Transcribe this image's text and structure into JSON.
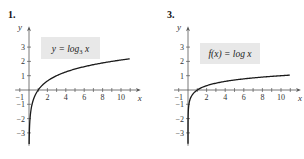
{
  "chart_data": [
    {
      "type": "line",
      "problem_number": "1.",
      "title": "",
      "annotation": "y = log₃ x",
      "annotation_parts": {
        "lhs": "y = log",
        "sub": "3",
        "rhs": " x"
      },
      "xlabel": "x",
      "ylabel": "y",
      "xlim": [
        -1.5,
        11.5
      ],
      "ylim": [
        -3.9,
        4.1
      ],
      "xticks": [
        -1,
        1,
        2,
        3,
        4,
        5,
        6,
        7,
        8,
        9,
        10,
        11
      ],
      "xtick_labels": [
        {
          "v": -1,
          "t": "−1"
        },
        {
          "v": 2,
          "t": "2"
        },
        {
          "v": 4,
          "t": "4"
        },
        {
          "v": 6,
          "t": "6"
        },
        {
          "v": 8,
          "t": "8"
        },
        {
          "v": 10,
          "t": "10"
        }
      ],
      "yticks": [
        -3,
        -2,
        -1,
        1,
        2,
        3
      ],
      "ytick_labels": [
        {
          "v": -3,
          "t": "−3"
        },
        {
          "v": -2,
          "t": "−2"
        },
        {
          "v": -1,
          "t": "−1"
        },
        {
          "v": 1,
          "t": "1"
        },
        {
          "v": 2,
          "t": "2"
        },
        {
          "v": 3,
          "t": "3"
        }
      ],
      "grid": false,
      "function": "log3",
      "series": [
        {
          "name": "y = log3 x",
          "x": [
            0.02,
            0.05,
            0.1,
            0.2,
            0.33,
            0.5,
            1,
            1.5,
            2,
            3,
            4,
            5,
            6,
            7,
            8,
            9,
            10,
            11
          ],
          "y": [
            -3.56,
            -2.73,
            -2.1,
            -1.46,
            -1.0,
            -0.63,
            0,
            0.37,
            0.63,
            1.0,
            1.26,
            1.46,
            1.63,
            1.77,
            1.89,
            2.0,
            2.1,
            2.18
          ]
        }
      ]
    },
    {
      "type": "line",
      "problem_number": "3.",
      "title": "",
      "annotation": "f(x) = log x",
      "annotation_parts": {
        "lhs": "f(x) = log x",
        "sub": "",
        "rhs": ""
      },
      "xlabel": "x",
      "ylabel": "y",
      "xlim": [
        -1.5,
        11.5
      ],
      "ylim": [
        -3.9,
        4.1
      ],
      "xticks": [
        -1,
        1,
        2,
        3,
        4,
        5,
        6,
        7,
        8,
        9,
        10,
        11
      ],
      "xtick_labels": [
        {
          "v": -1,
          "t": "−1"
        },
        {
          "v": 2,
          "t": "2"
        },
        {
          "v": 4,
          "t": "4"
        },
        {
          "v": 6,
          "t": "6"
        },
        {
          "v": 8,
          "t": "8"
        },
        {
          "v": 10,
          "t": "10"
        }
      ],
      "yticks": [
        -3,
        -2,
        -1,
        1,
        2,
        3
      ],
      "ytick_labels": [
        {
          "v": -3,
          "t": "−3"
        },
        {
          "v": -2,
          "t": "−2"
        },
        {
          "v": -1,
          "t": "−1"
        },
        {
          "v": 1,
          "t": "1"
        },
        {
          "v": 2,
          "t": "2"
        },
        {
          "v": 3,
          "t": "3"
        }
      ],
      "grid": false,
      "function": "log10",
      "series": [
        {
          "name": "f(x) = log x",
          "x": [
            0.0002,
            0.001,
            0.005,
            0.01,
            0.05,
            0.1,
            0.3,
            0.5,
            1,
            2,
            3,
            4,
            5,
            6,
            7,
            8,
            9,
            10,
            11
          ],
          "y": [
            -3.7,
            -3.0,
            -2.3,
            -2.0,
            -1.3,
            -1.0,
            -0.52,
            -0.3,
            0,
            0.3,
            0.48,
            0.6,
            0.7,
            0.78,
            0.85,
            0.9,
            0.95,
            1.0,
            1.04
          ]
        }
      ]
    }
  ],
  "colors": {
    "curve": "#1a1a1a",
    "axis": "#555555",
    "label_box": "#e8e8e8"
  }
}
